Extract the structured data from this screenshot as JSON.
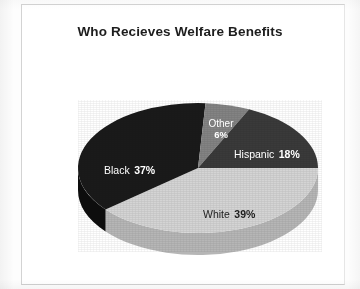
{
  "figure": {
    "title": "Who Recieves Welfare Benefits",
    "frame_color": "#d3d3d3",
    "background_color": "#ffffff"
  },
  "chart_data": {
    "type": "pie",
    "title": "Who Recieves Welfare Benefits",
    "xlabel": "",
    "ylabel": "",
    "legend": "none",
    "grid": false,
    "three_d": true,
    "units": "percent",
    "categories": [
      "White",
      "Black",
      "Hispanic",
      "Other"
    ],
    "values": [
      39,
      37,
      18,
      6
    ],
    "slices": [
      {
        "label": "White",
        "value": 39,
        "value_text": "39%",
        "color": "#d4d4d4",
        "side_color": "#b6b6b6",
        "label_color": "#1c1c1c",
        "start_angle_deg": 0,
        "end_angle_deg": 140.4
      },
      {
        "label": "Black",
        "value": 37,
        "value_text": "37%",
        "color": "#1a1a1a",
        "side_color": "#0d0d0d",
        "label_color": "#ffffff",
        "start_angle_deg": 140.4,
        "end_angle_deg": 273.6
      },
      {
        "label": "Other",
        "value": 6,
        "value_text": "6%",
        "color": "#838383",
        "side_color": "#6a6a6a",
        "label_color": "#ffffff",
        "start_angle_deg": 273.6,
        "end_angle_deg": 295.2
      },
      {
        "label": "Hispanic",
        "value": 18,
        "value_text": "18%",
        "color": "#3a3a3a",
        "side_color": "#262626",
        "label_color": "#ffffff",
        "start_angle_deg": 295.2,
        "end_angle_deg": 360
      }
    ]
  },
  "labels": {
    "other": {
      "name": "Other",
      "percent": "6%"
    },
    "hispanic": {
      "name": "Hispanic",
      "percent": "18%"
    },
    "black": {
      "name": "Black",
      "percent": "37%"
    },
    "white": {
      "name": "White",
      "percent": "39%"
    }
  }
}
